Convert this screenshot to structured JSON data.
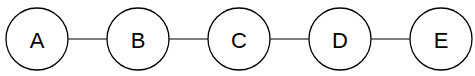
{
  "diagram": {
    "type": "linear-graph",
    "nodes": [
      {
        "id": "A",
        "label": "A"
      },
      {
        "id": "B",
        "label": "B"
      },
      {
        "id": "C",
        "label": "C"
      },
      {
        "id": "D",
        "label": "D"
      },
      {
        "id": "E",
        "label": "E"
      }
    ],
    "edges": [
      {
        "from": "A",
        "to": "B"
      },
      {
        "from": "B",
        "to": "C"
      },
      {
        "from": "C",
        "to": "D"
      },
      {
        "from": "D",
        "to": "E"
      }
    ]
  }
}
